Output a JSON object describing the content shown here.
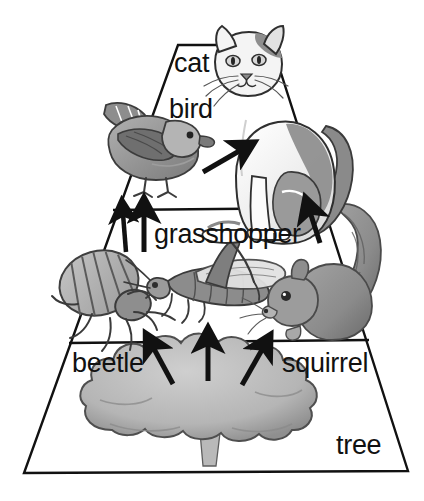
{
  "figure": {
    "type": "energy-pyramid-food-chain",
    "background_color": "#ffffff",
    "outline_color": "#111111",
    "width": 424,
    "height": 501
  },
  "tiers": [
    {
      "name": "top-tier",
      "level": 3,
      "labels": [
        "cat",
        "bird"
      ],
      "organisms": [
        "cat",
        "bird"
      ]
    },
    {
      "name": "middle-tier",
      "level": 2,
      "labels": [
        "grasshopper"
      ],
      "organisms": [
        "grasshopper",
        "beetle",
        "squirrel"
      ]
    },
    {
      "name": "bottom-tier",
      "level": 1,
      "labels": [
        "beetle",
        "squirrel",
        "tree"
      ],
      "organisms": [
        "tree"
      ]
    }
  ],
  "labels": {
    "cat": "cat",
    "bird": "bird",
    "grasshopper": "grasshopper",
    "beetle": "beetle",
    "squirrel": "squirrel",
    "tree": "tree"
  },
  "arrows": [
    {
      "name": "arrow-bird-to-cat",
      "from": [
        205,
        171
      ],
      "to": [
        243,
        149
      ]
    },
    {
      "name": "arrow-grasshopper-to-bird-1",
      "from": [
        126,
        252
      ],
      "to": [
        123,
        211
      ]
    },
    {
      "name": "arrow-grasshopper-to-bird-2",
      "from": [
        144,
        252
      ],
      "to": [
        144,
        210
      ]
    },
    {
      "name": "arrow-squirrel-to-top-tier",
      "from": [
        320,
        243
      ],
      "to": [
        309,
        209
      ]
    },
    {
      "name": "arrow-tree-to-beetle",
      "from": [
        172,
        383
      ],
      "to": [
        152,
        344
      ]
    },
    {
      "name": "arrow-tree-to-grasshopper",
      "from": [
        208,
        380
      ],
      "to": [
        208,
        339
      ]
    },
    {
      "name": "arrow-tree-to-squirrel",
      "from": [
        243,
        384
      ],
      "to": [
        264,
        345
      ]
    }
  ],
  "illustrations": [
    {
      "name": "cat-illustration",
      "organism": "cat"
    },
    {
      "name": "bird-illustration",
      "organism": "bird"
    },
    {
      "name": "grasshopper-illustration",
      "organism": "grasshopper"
    },
    {
      "name": "beetle-illustration",
      "organism": "beetle"
    },
    {
      "name": "squirrel-illustration",
      "organism": "squirrel"
    },
    {
      "name": "tree-illustration",
      "organism": "tree"
    }
  ],
  "palette": {
    "outline": "#111111",
    "fill_light": "#c9c9c9",
    "fill_mid": "#9a9a9a",
    "fill_dark": "#6f6f6f",
    "fill_darkest": "#4a4a4a",
    "white": "#ffffff"
  }
}
